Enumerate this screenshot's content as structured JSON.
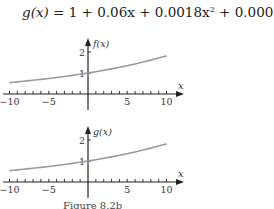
{
  "formula": {
    "text": "g(x) = 1 + 0.06x + 0.0018x² + 0.000036x³",
    "lhs": "g(x)",
    "terms": [
      "1",
      "0.06x",
      "0.0018x",
      "0.000036x"
    ],
    "exponents": [
      "2",
      "3"
    ]
  },
  "caption": "Figure 8.2b",
  "chart_data": [
    {
      "type": "line",
      "title": "",
      "xlabel": "x",
      "ylabel": "f(x)",
      "xlim": [
        -10,
        10
      ],
      "ylim": [
        0,
        2.5
      ],
      "x_ticks": [
        -10,
        -5,
        5,
        10
      ],
      "y_ticks": [
        1,
        2
      ],
      "grid": false,
      "legend": null,
      "series": [
        {
          "name": "f(x)",
          "color": "#9a9a9a",
          "x": [
            -10,
            -5,
            0,
            5,
            10
          ],
          "y": [
            0.544,
            0.741,
            1.0,
            1.35,
            1.816
          ]
        }
      ]
    },
    {
      "type": "line",
      "title": "",
      "xlabel": "x",
      "ylabel": "g(x)",
      "xlim": [
        -10,
        10
      ],
      "ylim": [
        0,
        2.5
      ],
      "x_ticks": [
        -10,
        -5,
        5,
        10
      ],
      "y_ticks": [
        1,
        2
      ],
      "grid": false,
      "legend": null,
      "series": [
        {
          "name": "g(x) = 1 + 0.06x + 0.0018x^2 + 0.000036x^3",
          "color": "#9a9a9a",
          "x": [
            -10,
            -5,
            0,
            5,
            10
          ],
          "y": [
            0.544,
            0.741,
            1.0,
            1.35,
            1.816
          ]
        }
      ]
    }
  ]
}
